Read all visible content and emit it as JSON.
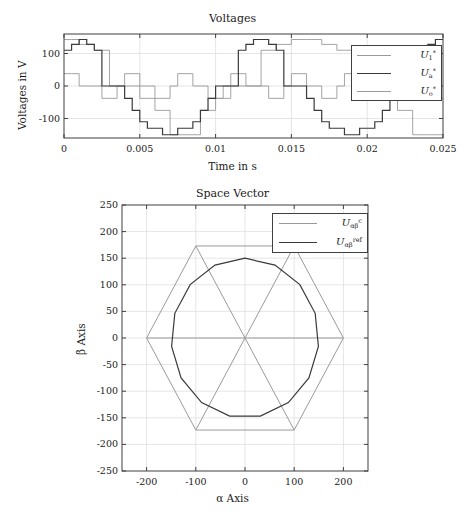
{
  "figure": {
    "width": 465,
    "height": 520,
    "background": "#ffffff"
  },
  "colors": {
    "series_light": "#9a9a9a",
    "series_dark": "#3a3a3a",
    "axis": "#3f3f3f",
    "grid": "#dedede",
    "text": "#1a1a1a"
  },
  "charts": [
    {
      "id": "voltages",
      "title": "Voltages",
      "xlabel": "Time in s",
      "ylabel": "Voltages in V",
      "xticks": [
        0,
        0.005,
        0.01,
        0.015,
        0.02,
        0.025
      ],
      "xtick_labels": [
        "0",
        "0.005",
        "0.01",
        "0.015",
        "0.02",
        "0.025"
      ],
      "yticks": [
        100,
        0,
        -100
      ],
      "ytick_labels": [
        "100",
        "0",
        "-100"
      ],
      "legend": [
        {
          "label_html": "<i>U</i><sub>1</sub><sup>*</sup>",
          "color": "#9a9a9a",
          "name": "u1-ref"
        },
        {
          "label_html": "<i>U</i><sub>a</sub><sup>*</sup>",
          "color": "#3a3a3a",
          "name": "ua-ref"
        },
        {
          "label_html": "<i>U</i><sub>o</sub><sup>*</sup>",
          "color": "#9a9a9a",
          "name": "uo-ref"
        }
      ]
    },
    {
      "id": "space-vector",
      "title": "Space Vector",
      "xlabel": "α Axis",
      "ylabel": "β Axis",
      "xticks": [
        -200,
        -100,
        0,
        100,
        200
      ],
      "xtick_labels": [
        "-200",
        "-100",
        "0",
        "100",
        "200"
      ],
      "yticks": [
        250,
        200,
        150,
        100,
        50,
        0,
        -50,
        -100,
        -150,
        -200,
        -250
      ],
      "ytick_labels": [
        "250",
        "200",
        "150",
        "100",
        "50",
        "0",
        "-50",
        "-100",
        "-150",
        "-200",
        "-250"
      ],
      "legend": [
        {
          "label_html": "<i>U</i><sub>αβ</sub><sup>c</sup>",
          "color": "#9a9a9a",
          "name": "u-alphabeta-c"
        },
        {
          "label_html": "<i>U</i><sub>αβ</sub><sup>ref</sup>",
          "color": "#3a3a3a",
          "name": "u-alphabeta-ref"
        }
      ]
    }
  ],
  "chart_data": [
    {
      "type": "line",
      "id": "voltages",
      "title": "Voltages",
      "xlabel": "Time in s",
      "ylabel": "Voltages in V",
      "xlim": [
        0,
        0.025
      ],
      "ylim": [
        -160,
        160
      ],
      "grid": true,
      "legend_position": "upper-right-inside",
      "x_step": 0.0005,
      "series": [
        {
          "name": "U_1^*",
          "color": "#9a9a9a",
          "style": "staircase",
          "values": [
            143,
            143,
            128,
            128,
            110,
            110,
            0,
            0,
            0,
            0,
            -38,
            -38,
            -75,
            -75,
            -150,
            -150,
            -150,
            -150,
            -75,
            -75,
            -38,
            -38,
            0,
            0,
            0,
            0,
            110,
            110,
            128,
            128,
            143,
            143,
            143,
            143,
            128,
            128,
            110,
            110,
            0,
            0,
            0,
            0,
            -38,
            -38,
            -75,
            -75,
            -150,
            -150,
            -150,
            -150,
            -75
          ]
        },
        {
          "name": "U_a^*",
          "color": "#3a3a3a",
          "style": "staircase",
          "values": [
            110,
            128,
            143,
            128,
            110,
            0,
            0,
            0,
            -38,
            -75,
            -110,
            -130,
            -130,
            -150,
            -150,
            -130,
            -130,
            -110,
            -75,
            -38,
            0,
            0,
            0,
            110,
            128,
            143,
            143,
            128,
            110,
            0,
            0,
            0,
            -38,
            -75,
            -110,
            -130,
            -130,
            -150,
            -150,
            -130,
            -130,
            -110,
            -75,
            -38,
            0,
            0,
            0,
            110,
            128,
            143,
            143
          ]
        },
        {
          "name": "U_o^*",
          "color": "#9a9a9a",
          "style": "staircase",
          "values": [
            38,
            38,
            0,
            0,
            0,
            -38,
            -38,
            0,
            38,
            38,
            0,
            0,
            -38,
            -38,
            0,
            38,
            38,
            0,
            0,
            -38,
            -38,
            0,
            38,
            38,
            0,
            0,
            0,
            -38,
            -38,
            0,
            38,
            38,
            0,
            0,
            -38,
            -38,
            0,
            38,
            38,
            0,
            0,
            -38,
            -38,
            0,
            38,
            38,
            0,
            0,
            0,
            -38,
            -38
          ]
        }
      ]
    },
    {
      "type": "line",
      "id": "space-vector",
      "title": "Space Vector",
      "xlabel": "α Axis",
      "ylabel": "β Axis",
      "xlim": [
        -250,
        250
      ],
      "ylim": [
        -250,
        250
      ],
      "grid": true,
      "legend_position": "upper-right-inside",
      "series": [
        {
          "name": "U_ab^c",
          "color": "#9a9a9a",
          "description": "hexagon with six radial spokes to vertices",
          "hexagon_vertices": [
            [
              200,
              0
            ],
            [
              100,
              173
            ],
            [
              -100,
              173
            ],
            [
              -200,
              0
            ],
            [
              -100,
              -173
            ],
            [
              100,
              -173
            ]
          ],
          "spokes_from": [
            0,
            0
          ]
        },
        {
          "name": "U_ab^ref",
          "color": "#3a3a3a",
          "description": "15-sided polygon approximating circle of radius 150",
          "radius": 150,
          "n_sides": 15,
          "phase_deg": 90
        }
      ]
    }
  ]
}
